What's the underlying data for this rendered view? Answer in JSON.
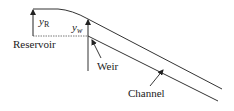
{
  "diagram": {
    "labels": {
      "yR_main": "y",
      "yR_sub": "R",
      "yw_main": "y",
      "yw_sub": "w",
      "reservoir": "Reservoir",
      "weir": "Weir",
      "channel": "Channel"
    },
    "colors": {
      "line": "#333333",
      "dashed": "#555555",
      "text": "#222222"
    }
  }
}
